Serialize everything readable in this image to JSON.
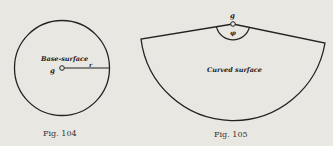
{
  "figures": [
    {
      "caption": "Fig. 104",
      "labels": {
        "surface": "Base-surface",
        "radius": "r",
        "point": "g"
      }
    },
    {
      "caption": "Fig. 105",
      "labels": {
        "surface": "Curved surface",
        "point": "g",
        "angle": "φ"
      }
    }
  ],
  "colors": {
    "background": "#e9e7e2",
    "ink": "#222222"
  }
}
